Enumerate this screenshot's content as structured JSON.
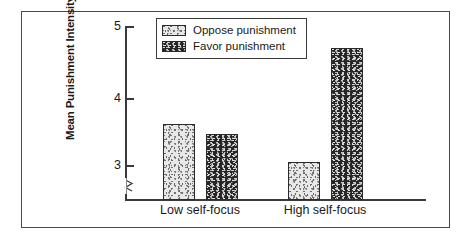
{
  "chart_data": {
    "type": "bar",
    "title": "",
    "xlabel": "",
    "ylabel": "Mean Punishment Intensity",
    "categories": [
      "Low self-focus",
      "High self-focus"
    ],
    "series": [
      {
        "name": "Oppose punishment",
        "values": [
          3.6,
          3.05
        ],
        "fill": "light-stipple",
        "color": "#e8e8e8"
      },
      {
        "name": "Favor punishment",
        "values": [
          3.45,
          4.7
        ],
        "fill": "dark-stipple",
        "color": "#262626"
      }
    ],
    "ylim": [
      2.75,
      5
    ],
    "yticks": [
      3,
      4,
      5
    ],
    "ytick_labels": [
      "3",
      "4",
      "5"
    ],
    "axis_break": true,
    "grid": false,
    "legend_position": "top-center"
  },
  "axis": {
    "ytick_5": "5",
    "ytick_4": "4",
    "ytick_3": "3",
    "ylabel": "Mean Punishment Intensity"
  },
  "legend": {
    "items": [
      {
        "label": "Oppose punishment"
      },
      {
        "label": "Favor punishment"
      }
    ]
  },
  "categories": {
    "low": "Low self-focus",
    "high": "High self-focus"
  }
}
